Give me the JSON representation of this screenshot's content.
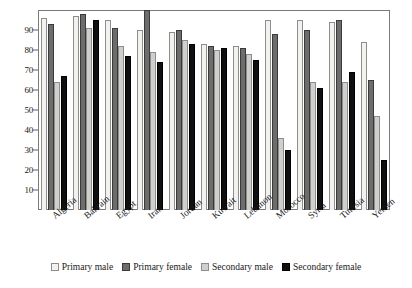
{
  "chart_data": {
    "type": "bar",
    "title": "",
    "xlabel": "",
    "ylabel": "",
    "ylim": [
      0,
      100
    ],
    "yticks": [
      10,
      20,
      30,
      40,
      50,
      60,
      70,
      80,
      90
    ],
    "grid": false,
    "legend_position": "bottom",
    "categories": [
      "Algeria",
      "Bahrain",
      "Egypt",
      "Iran",
      "Jordan",
      "Kuwait",
      "Lebanon",
      "Morocco",
      "Syria",
      "Tunisia",
      "Yemen"
    ],
    "series": [
      {
        "name": "Primary male",
        "color": "#f2f1ee",
        "values": [
          96,
          97,
          95,
          90,
          89,
          83,
          82,
          95,
          95,
          94,
          84
        ]
      },
      {
        "name": "Primary female",
        "color": "#6d6d6d",
        "values": [
          93,
          98,
          91,
          100,
          90,
          82,
          81,
          88,
          90,
          95,
          65
        ]
      },
      {
        "name": "Secondary male",
        "color": "#cfcfcb",
        "values": [
          64,
          91,
          82,
          79,
          85,
          80,
          78,
          36,
          64,
          64,
          47
        ]
      },
      {
        "name": "Secondary female",
        "color": "#100f0f",
        "values": [
          67,
          95,
          77,
          74,
          83,
          81,
          75,
          30,
          61,
          69,
          25
        ]
      }
    ]
  },
  "legend": {
    "items": [
      {
        "label": "Primary male",
        "swatch": "legend-swatch-primary-male"
      },
      {
        "label": "Primary female",
        "swatch": "legend-swatch-primary-female"
      },
      {
        "label": "Secondary male",
        "swatch": "legend-swatch-secondary-male"
      },
      {
        "label": "Secondary female",
        "swatch": "legend-swatch-secondary-female"
      }
    ]
  }
}
